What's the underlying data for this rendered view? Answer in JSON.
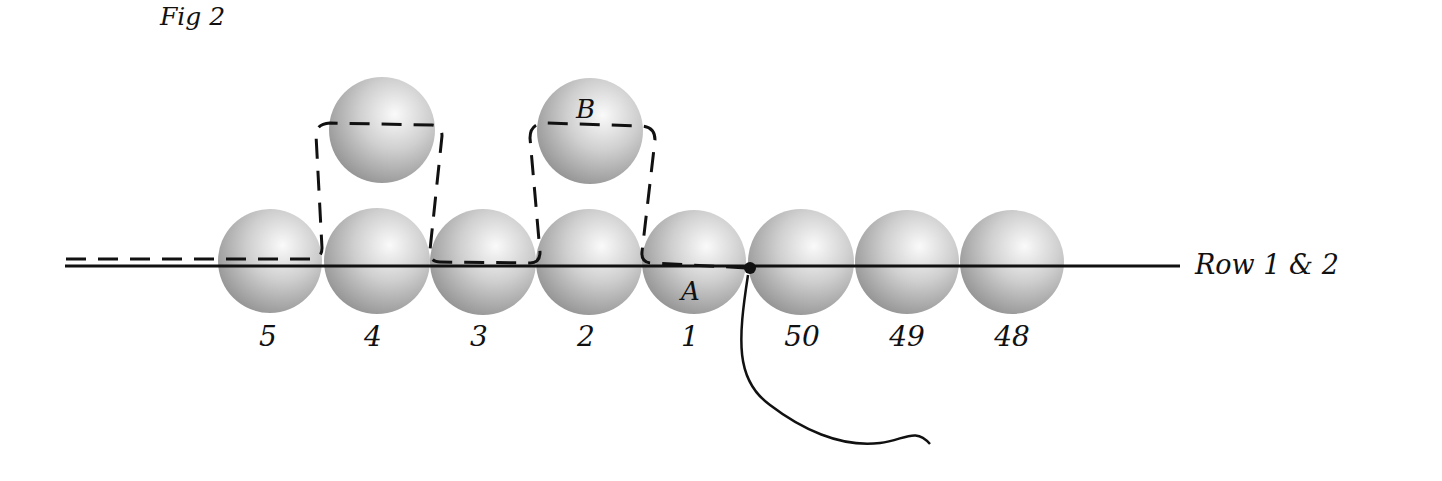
{
  "figure": {
    "title": "Fig 2",
    "row_label": "Row 1 & 2",
    "point_a_label": "A",
    "point_b_label": "B",
    "bead_numbers": [
      "5",
      "4",
      "3",
      "2",
      "1",
      "50",
      "49",
      "48"
    ],
    "colors": {
      "bead_light": "#f4f4f4",
      "bead_mid": "#c8c8c8",
      "bead_dark": "#8a8a8a",
      "thread": "#111111"
    }
  }
}
